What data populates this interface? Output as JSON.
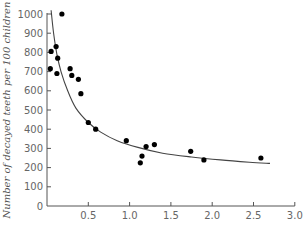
{
  "chart_data": {
    "type": "scatter",
    "title": "",
    "xlabel": "",
    "ylabel": "Number of decayed teeth per 100 children",
    "xlim": [
      0,
      3.0
    ],
    "ylim": [
      0,
      1000
    ],
    "x_ticks": [
      "0.5",
      "1.0",
      "1.5",
      "2.0",
      "2.5",
      "3.0"
    ],
    "x_tick_values": [
      0.5,
      1.0,
      1.5,
      2.0,
      2.5,
      3.0
    ],
    "y_ticks": [
      "0",
      "100",
      "200",
      "300",
      "400",
      "500",
      "600",
      "700",
      "800",
      "900",
      "1000"
    ],
    "y_tick_values": [
      0,
      100,
      200,
      300,
      400,
      500,
      600,
      700,
      800,
      900,
      1000
    ],
    "grid": false,
    "legend": null,
    "series": [
      {
        "name": "observations",
        "type": "scatter",
        "points": [
          {
            "x": 0.18,
            "y": 1000
          },
          {
            "x": 0.05,
            "y": 805
          },
          {
            "x": 0.11,
            "y": 830
          },
          {
            "x": 0.13,
            "y": 770
          },
          {
            "x": 0.04,
            "y": 715
          },
          {
            "x": 0.12,
            "y": 690
          },
          {
            "x": 0.28,
            "y": 715
          },
          {
            "x": 0.3,
            "y": 680
          },
          {
            "x": 0.38,
            "y": 660
          },
          {
            "x": 0.41,
            "y": 585
          },
          {
            "x": 0.5,
            "y": 435
          },
          {
            "x": 0.59,
            "y": 400
          },
          {
            "x": 0.96,
            "y": 340
          },
          {
            "x": 1.2,
            "y": 310
          },
          {
            "x": 1.3,
            "y": 320
          },
          {
            "x": 1.15,
            "y": 260
          },
          {
            "x": 1.13,
            "y": 225
          },
          {
            "x": 1.74,
            "y": 285
          },
          {
            "x": 1.9,
            "y": 240
          },
          {
            "x": 2.59,
            "y": 250
          }
        ]
      },
      {
        "name": "fitted curve",
        "type": "line",
        "points": [
          {
            "x": 0.05,
            "y": 1020
          },
          {
            "x": 0.08,
            "y": 900
          },
          {
            "x": 0.12,
            "y": 790
          },
          {
            "x": 0.17,
            "y": 700
          },
          {
            "x": 0.25,
            "y": 600
          },
          {
            "x": 0.35,
            "y": 510
          },
          {
            "x": 0.5,
            "y": 435
          },
          {
            "x": 0.65,
            "y": 385
          },
          {
            "x": 0.85,
            "y": 340
          },
          {
            "x": 1.1,
            "y": 305
          },
          {
            "x": 1.4,
            "y": 275
          },
          {
            "x": 1.75,
            "y": 255
          },
          {
            "x": 2.1,
            "y": 240
          },
          {
            "x": 2.45,
            "y": 228
          },
          {
            "x": 2.7,
            "y": 222
          }
        ]
      }
    ]
  },
  "colors": {
    "axis": "#555555",
    "marker": "#000000",
    "curve": "#444444",
    "tick_text": "#666666"
  }
}
